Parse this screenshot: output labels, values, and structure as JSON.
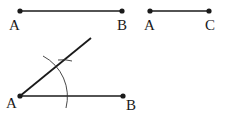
{
  "diagram": {
    "type": "angle-construction",
    "segments": [
      {
        "name": "segment-AB-top",
        "from": "A",
        "to": "B",
        "labels": [
          "A",
          "B"
        ]
      },
      {
        "name": "segment-AC-top",
        "from": "A",
        "to": "C",
        "labels": [
          "A",
          "C"
        ]
      },
      {
        "name": "segment-AB-bottom",
        "from": "A",
        "to": "B",
        "labels": [
          "A",
          "B"
        ]
      }
    ],
    "labels": {
      "top_a1": "A",
      "top_b": "B",
      "top_a2": "A",
      "top_c": "C",
      "bottom_a": "A",
      "bottom_b": "B"
    },
    "stroke_color": "#1a1a1a"
  }
}
